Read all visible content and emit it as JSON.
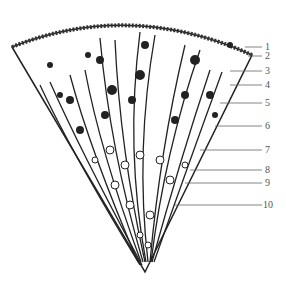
{
  "figure": {
    "type": "anatomical line drawing (cone-shaped section)",
    "labels": [
      {
        "num": "1",
        "y": 47
      },
      {
        "num": "2",
        "y": 56
      },
      {
        "num": "3",
        "y": 71
      },
      {
        "num": "4",
        "y": 85
      },
      {
        "num": "5",
        "y": 103
      },
      {
        "num": "6",
        "y": 126
      },
      {
        "num": "7",
        "y": 150
      },
      {
        "num": "8",
        "y": 170
      },
      {
        "num": "9",
        "y": 183
      },
      {
        "num": "10",
        "y": 205
      }
    ],
    "colors": {
      "ink": "#222222",
      "label": "#555555",
      "background": "#ffffff"
    }
  }
}
